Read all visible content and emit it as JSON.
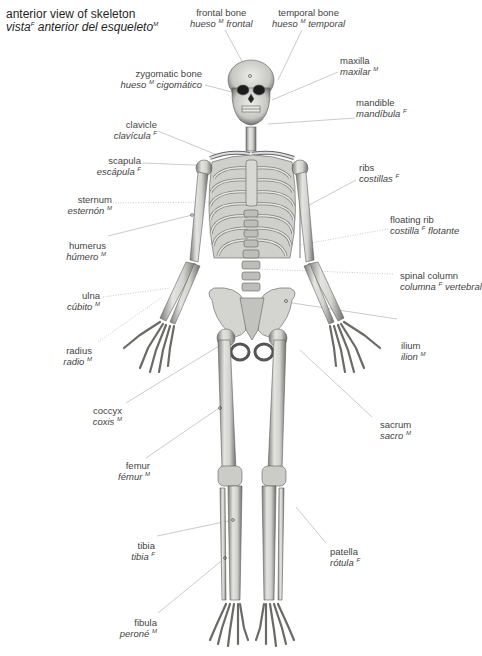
{
  "title": {
    "en": "anterior view of skeleton",
    "es_pre": "vista",
    "es_gender": "F",
    "es_post": "anterior del esqueleto",
    "es_gender2": "M"
  },
  "labels": [
    {
      "id": "frontal-bone",
      "en": "frontal bone",
      "es": "hueso",
      "g": "M",
      "es2": "frontal"
    },
    {
      "id": "temporal-bone",
      "en": "temporal bone",
      "es": "hueso",
      "g": "M",
      "es2": "temporal"
    },
    {
      "id": "zygomatic-bone",
      "en": "zygomatic bone",
      "es": "hueso",
      "g": "M",
      "es2": "cigomático"
    },
    {
      "id": "maxilla",
      "en": "maxilla",
      "es": "maxilar",
      "g": "M",
      "es2": ""
    },
    {
      "id": "mandible",
      "en": "mandible",
      "es": "mandíbula",
      "g": "F",
      "es2": ""
    },
    {
      "id": "clavicle",
      "en": "clavicle",
      "es": "clavícula",
      "g": "F",
      "es2": ""
    },
    {
      "id": "scapula",
      "en": "scapula",
      "es": "escápula",
      "g": "F",
      "es2": ""
    },
    {
      "id": "ribs",
      "en": "ribs",
      "es": "costillas",
      "g": "F",
      "es2": ""
    },
    {
      "id": "sternum",
      "en": "sternum",
      "es": "esternón",
      "g": "M",
      "es2": ""
    },
    {
      "id": "floating-rib",
      "en": "floating rib",
      "es": "costilla",
      "g": "F",
      "es2": "flotante"
    },
    {
      "id": "humerus",
      "en": "humerus",
      "es": "húmero",
      "g": "M",
      "es2": ""
    },
    {
      "id": "spinal-column",
      "en": "spinal column",
      "es": "columna",
      "g": "F",
      "es2": "vertebral"
    },
    {
      "id": "ulna",
      "en": "ulna",
      "es": "cúbito",
      "g": "M",
      "es2": ""
    },
    {
      "id": "ilium",
      "en": "ilium",
      "es": "ilion",
      "g": "M",
      "es2": ""
    },
    {
      "id": "radius",
      "en": "radius",
      "es": "radio",
      "g": "M",
      "es2": ""
    },
    {
      "id": "coccyx",
      "en": "coccyx",
      "es": "coxis",
      "g": "M",
      "es2": ""
    },
    {
      "id": "sacrum",
      "en": "sacrum",
      "es": "sacro",
      "g": "M",
      "es2": ""
    },
    {
      "id": "femur",
      "en": "femur",
      "es": "fémur",
      "g": "M",
      "es2": ""
    },
    {
      "id": "tibia",
      "en": "tibia",
      "es": "tibia",
      "g": "F",
      "es2": ""
    },
    {
      "id": "patella",
      "en": "patella",
      "es": "rótula",
      "g": "F",
      "es2": ""
    },
    {
      "id": "fibula",
      "en": "fibula",
      "es": "peroné",
      "g": "M",
      "es2": ""
    }
  ],
  "colors": {
    "bone": "#d9d9d6",
    "bone_shade": "#8a8a86",
    "line": "#b5b5b5",
    "text": "#444444"
  }
}
